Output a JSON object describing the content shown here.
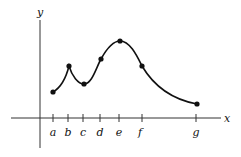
{
  "figure": {
    "axis_labels": {
      "x": "x",
      "y": "y"
    },
    "ticks": [
      {
        "label": "a",
        "x": 53
      },
      {
        "label": "b",
        "x": 68
      },
      {
        "label": "c",
        "x": 83
      },
      {
        "label": "d",
        "x": 100
      },
      {
        "label": "e",
        "x": 119
      },
      {
        "label": "f",
        "x": 142
      },
      {
        "label": "g",
        "x": 196
      }
    ],
    "points": [
      {
        "name": "a",
        "x": 53,
        "y": 92
      },
      {
        "name": "b",
        "x": 69,
        "y": 66
      },
      {
        "name": "c",
        "x": 84,
        "y": 84
      },
      {
        "name": "d",
        "x": 101,
        "y": 59
      },
      {
        "name": "e",
        "x": 120,
        "y": 41
      },
      {
        "name": "f",
        "x": 142,
        "y": 66
      },
      {
        "name": "g",
        "x": 197,
        "y": 104
      }
    ],
    "stroke_color": "#111111"
  }
}
